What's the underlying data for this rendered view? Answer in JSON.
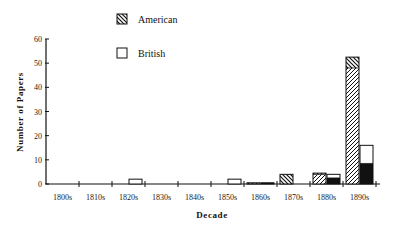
{
  "chart_data": {
    "type": "bar",
    "stacked": true,
    "title": "",
    "xlabel": "Decade",
    "ylabel": "Number of Papers",
    "ylim": [
      0,
      60
    ],
    "yticks": [
      0,
      10,
      20,
      30,
      40,
      50,
      60
    ],
    "grid": false,
    "legend_position": "top-center",
    "categories": [
      "1800s",
      "1810s",
      "1820s",
      "1830s",
      "1840s",
      "1850s",
      "1860s",
      "1870s",
      "1880s",
      "1890s"
    ],
    "series": [
      {
        "name": "American",
        "group": "American",
        "pattern": "hatch-forward",
        "values": [
          0,
          0,
          0,
          0,
          0,
          0,
          0.5,
          0,
          4,
          48
        ]
      },
      {
        "name": "American",
        "group": "American",
        "pattern": "hatch-back",
        "values": [
          0,
          0,
          0,
          0,
          0,
          0,
          0,
          4,
          0.5,
          4.5
        ]
      },
      {
        "name": "British",
        "group": "British",
        "pattern": "solid-black",
        "values": [
          0,
          0,
          0,
          0,
          0,
          0,
          0.5,
          0,
          2.5,
          8.5
        ]
      },
      {
        "name": "British",
        "group": "British",
        "pattern": "white",
        "values": [
          0,
          0,
          2,
          0,
          0,
          2,
          0,
          0,
          1.5,
          7.5
        ]
      }
    ],
    "legend": [
      {
        "label": "American",
        "pattern": "hatch-back"
      },
      {
        "label": "British",
        "pattern": "white"
      }
    ]
  },
  "legend": {
    "american": "American",
    "british": "British"
  },
  "axes": {
    "x_title": "Decade",
    "y_title": "Number of Papers"
  }
}
